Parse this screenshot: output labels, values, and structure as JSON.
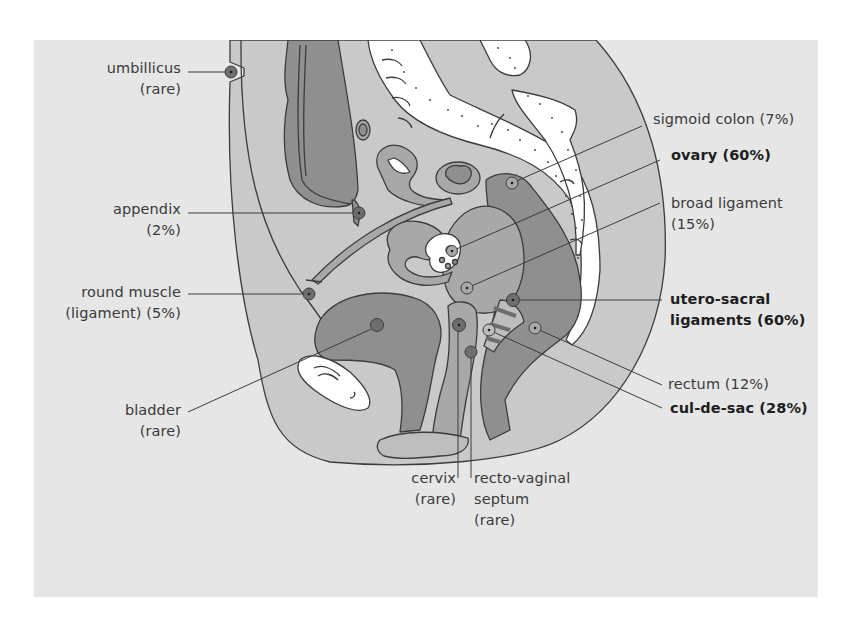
{
  "figure": {
    "colors": {
      "background_panel": "#e6e6e6",
      "page": "#ffffff",
      "tissue_light": "#c9c9c9",
      "tissue_mid": "#a8a8a8",
      "tissue_dark": "#8a8a8a",
      "bone_white": "#ffffff",
      "outline": "#3c3c3c",
      "marker": "#6e6e6e"
    }
  },
  "labels": {
    "umbilicus": {
      "line1": "umbillicus",
      "line2": "(rare)",
      "bold": false
    },
    "appendix": {
      "line1": "appendix",
      "line2": "(2%)",
      "bold": false
    },
    "round_muscle": {
      "line1": "round muscle",
      "line2": "(ligament) (5%)",
      "bold": false
    },
    "bladder": {
      "line1": "bladder",
      "line2": "(rare)",
      "bold": false
    },
    "sigmoid_colon": {
      "line1": "sigmoid colon (7%)",
      "bold": false
    },
    "ovary": {
      "line1": "ovary (60%)",
      "bold": true
    },
    "broad_ligament": {
      "line1": "broad ligament",
      "line2": "(15%)",
      "bold": false
    },
    "utero_sacral": {
      "line1": "utero-sacral",
      "line2": "ligaments (60%)",
      "bold": true
    },
    "rectum": {
      "line1": "rectum (12%)",
      "bold": false
    },
    "cul_de_sac": {
      "line1": "cul-de-sac (28%)",
      "bold": true
    },
    "cervix": {
      "line1": "cervix",
      "line2": "(rare)",
      "bold": false
    },
    "recto_vaginal": {
      "line1": "recto-vaginal",
      "line2": "septum",
      "line3": "(rare)",
      "bold": false
    }
  },
  "sites": [
    {
      "name": "umbilicus",
      "frequency": "rare"
    },
    {
      "name": "appendix",
      "frequency": "2%"
    },
    {
      "name": "round muscle (ligament)",
      "frequency": "5%"
    },
    {
      "name": "bladder",
      "frequency": "rare"
    },
    {
      "name": "sigmoid colon",
      "frequency": "7%"
    },
    {
      "name": "ovary",
      "frequency": "60%"
    },
    {
      "name": "broad ligament",
      "frequency": "15%"
    },
    {
      "name": "utero-sacral ligaments",
      "frequency": "60%"
    },
    {
      "name": "rectum",
      "frequency": "12%"
    },
    {
      "name": "cul-de-sac",
      "frequency": "28%"
    },
    {
      "name": "cervix",
      "frequency": "rare"
    },
    {
      "name": "recto-vaginal septum",
      "frequency": "rare"
    }
  ]
}
